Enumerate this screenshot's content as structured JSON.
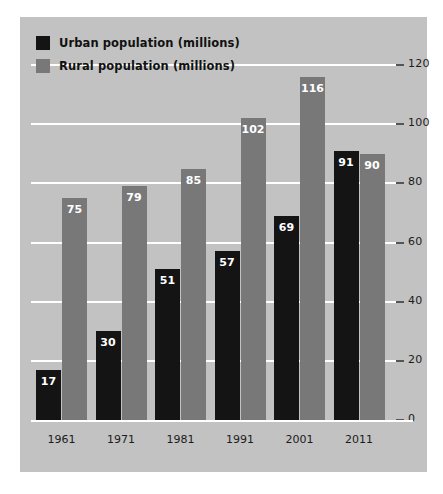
{
  "chart_data": {
    "type": "bar",
    "title": "",
    "xlabel": "",
    "ylabel": "",
    "categories": [
      "1961",
      "1971",
      "1981",
      "1991",
      "2001",
      "2011"
    ],
    "series": [
      {
        "name": "Urban population (millions)",
        "color": "#141414",
        "values": [
          17,
          30,
          51,
          57,
          69,
          91
        ]
      },
      {
        "name": "Rural population (millions)",
        "color": "#787878",
        "values": [
          75,
          79,
          85,
          102,
          116,
          90
        ]
      }
    ],
    "ylim": [
      0,
      120
    ],
    "yticks": [
      0,
      20,
      40,
      60,
      80,
      100,
      120
    ],
    "ytick_labels": [
      "0",
      "20",
      "40",
      "60",
      "80",
      "100",
      "120"
    ],
    "grid": true,
    "gridline_color": "#ffffff",
    "legend_position": "top-left",
    "axis_side": "right",
    "panel_color": "#c2c2c2",
    "background_color": "#ffffff",
    "data_labels": true
  },
  "legend": {
    "items": [
      {
        "label": "Urban population (millions)",
        "swatch": "urban"
      },
      {
        "label": "Rural population (millions)",
        "swatch": "rural"
      }
    ]
  }
}
